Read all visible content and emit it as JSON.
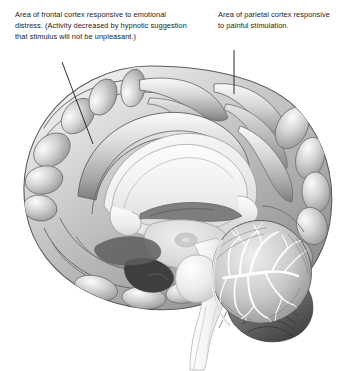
{
  "figure": {
    "type": "anatomical-illustration",
    "style": "grayscale shaded line drawing",
    "background_color": "#ffffff"
  },
  "annotations": [
    {
      "id": "frontal",
      "name": "frontal-cortex-callout",
      "text": "Area of frontal cortex responsive to emotional distress. (Activity decreased by hypnotic suggestion that stimulus will not be unpleasant.)",
      "lines": [
        "Area of frontal cortex responsive to",
        "emotional distress. (Activity decreased",
        "by hypnotic suggestion that stimulus",
        "will not be unpleasant.)"
      ],
      "leader_line": {
        "x1": 62,
        "y1": 62,
        "x2": 93,
        "y2": 144,
        "color": "#161616"
      },
      "target_structure": "anterior cingulate / medial frontal cortex"
    },
    {
      "id": "parietal",
      "name": "parietal-cortex-callout",
      "text": "Area of parietal cortex responsive to painful stimulation.",
      "lines": [
        "Area of parietal cortex",
        "responsive to painful",
        "stimulation."
      ],
      "leader_line": {
        "x1": 234,
        "y1": 50,
        "x2": 234,
        "y2": 94,
        "color": "#161616"
      },
      "target_structure": "medial parietal cortex"
    }
  ],
  "structures": [
    {
      "name": "cerebral-cortex",
      "label": "cerebral cortex"
    },
    {
      "name": "corpus-callosum",
      "label": "corpus callosum"
    },
    {
      "name": "thalamus",
      "label": "thalamus"
    },
    {
      "name": "brainstem",
      "label": "brainstem"
    },
    {
      "name": "pons",
      "label": "pons"
    },
    {
      "name": "medulla",
      "label": "medulla / spinal cord"
    },
    {
      "name": "cerebellum",
      "label": "cerebellum"
    }
  ],
  "palette": {
    "outline": "#4a4a4a",
    "cortex_light": "#e3e3e3",
    "cortex_mid": "#b9b9b9",
    "cortex_dark": "#8d8d8d",
    "sulcus_shadow": "#6e6e6e",
    "white_matter": "#f0f0f0",
    "corpus_callosum": "#ededed",
    "thalamus": "#dcdcdc",
    "brainstem": "#f2f2f2",
    "cerebellum_light": "#dcdcdc",
    "cerebellum_dark": "#4f4f4f",
    "leader_line": "#161616",
    "text": "#1b1b1b"
  }
}
